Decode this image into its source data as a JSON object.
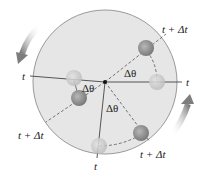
{
  "diagram": {
    "labels": {
      "t_left": "t",
      "t_right": "t",
      "t_bottom": "t",
      "t_dt_top_right": "t + Δt",
      "t_dt_left": "t + Δt",
      "t_dt_bottom_right": "t + Δt",
      "dtheta_1": "Δθ",
      "dtheta_2": "Δθ",
      "dtheta_3": "Δθ"
    },
    "colors": {
      "disk_fill": "#e6e6e6",
      "disk_stroke": "#9a9a9a",
      "particle_start": "#cfcfcf",
      "particle_end": "#8f8f8f",
      "line": "#444444",
      "arrow": "#8a8a8a"
    },
    "rotation_direction": "counterclockwise"
  }
}
